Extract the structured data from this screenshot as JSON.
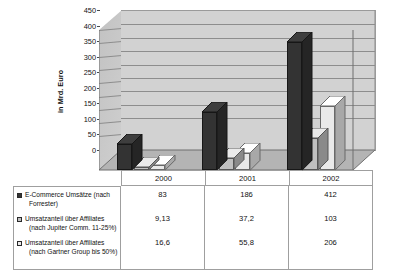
{
  "chart_data": {
    "type": "bar",
    "title": "",
    "xlabel": "",
    "ylabel": "in Mrd. Euro",
    "categories": [
      "2000",
      "2001",
      "2002"
    ],
    "ylim": [
      0,
      450
    ],
    "yticks": [
      0,
      50,
      100,
      150,
      200,
      250,
      300,
      350,
      400,
      450
    ],
    "grid": true,
    "legend_position": "table-left",
    "three_d": true,
    "series": [
      {
        "name": "E-Commerce Umsätze (nach Forrester)",
        "name_line1": "E-Commerce Umsätze (nach",
        "name_line2": "Forrester)",
        "color": "#333333",
        "values": [
          83,
          186,
          412
        ],
        "labels": [
          "83",
          "186",
          "412"
        ]
      },
      {
        "name": "Umsatzanteil über Affiliates (nach Jupiter Comm. 11-25%)",
        "name_line1": "Umsatzanteil über Affiliates",
        "name_line2": "(nach Jupiter Comm. 11-25%)",
        "color": "#c0c0c0",
        "values": [
          9.13,
          37.2,
          103
        ],
        "labels": [
          "9,13",
          "37,2",
          "103"
        ]
      },
      {
        "name": "Umsatzanteil über Affiliates (nach Gartner Group bis 50%)",
        "name_line1": "Umsatzanteil über Affiliates",
        "name_line2": "(nach Gartner Group bis 50%)",
        "color": "#e9e9e9",
        "values": [
          16.6,
          55.8,
          206
        ],
        "labels": [
          "16,6",
          "55,8",
          "206"
        ]
      }
    ]
  },
  "axis": {
    "ylabel": "in Mrd. Euro",
    "tick_0": "0",
    "tick_50": "50",
    "tick_100": "100",
    "tick_150": "150",
    "tick_200": "200",
    "tick_250": "250",
    "tick_300": "300",
    "tick_350": "350",
    "tick_400": "400",
    "tick_450": "450"
  },
  "table": {
    "categories": [
      "2000",
      "2001",
      "2002"
    ],
    "rows": [
      {
        "legend_line1": "E-Commerce Umsätze (nach",
        "legend_line2": "Forrester)",
        "values": [
          "83",
          "186",
          "412"
        ]
      },
      {
        "legend_line1": "Umsatzanteil über Affiliates",
        "legend_line2": "(nach Jupiter Comm. 11-25%)",
        "values": [
          "9,13",
          "37,2",
          "103"
        ]
      },
      {
        "legend_line1": "Umsatzanteil über Affiliates",
        "legend_line2": "(nach Gartner Group bis 50%)",
        "values": [
          "16,6",
          "55,8",
          "206"
        ]
      }
    ]
  },
  "colors": {
    "series1": "#333333",
    "series2": "#c0c0c0",
    "series3": "#e9e9e9",
    "plot_wall": "#d2d2d2",
    "floor": "#b4b4b4",
    "gridline": "#8d8d8d",
    "border": "#9f9f9f"
  }
}
